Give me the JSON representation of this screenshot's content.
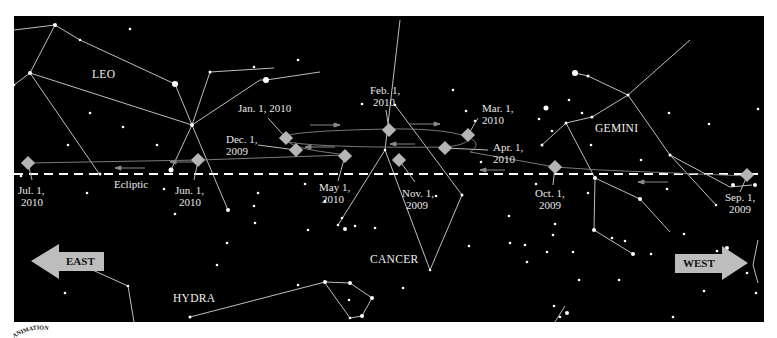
{
  "constellations": {
    "leo": "LEO",
    "gemini": "GEMINI",
    "cancer": "CANCER",
    "hydra": "HYDRA"
  },
  "ecliptic_label": "Ecliptic",
  "directions": {
    "east": "EAST",
    "west": "WEST"
  },
  "positions": [
    {
      "line1": "Sep. 1,",
      "line2": "2009"
    },
    {
      "line1": "Oct. 1,",
      "line2": "2009"
    },
    {
      "line1": "Nov. 1,",
      "line2": "2009"
    },
    {
      "line1": "Dec. 1,",
      "line2": "2009"
    },
    {
      "line1": "Jan. 1, 2010",
      "line2": ""
    },
    {
      "line1": "Feb. 1,",
      "line2": "2010"
    },
    {
      "line1": "Mar. 1,",
      "line2": "2010"
    },
    {
      "line1": "Apr. 1,",
      "line2": "2010"
    },
    {
      "line1": "May 1,",
      "line2": "2010"
    },
    {
      "line1": "Jun. 1,",
      "line2": "2010"
    },
    {
      "line1": "Jul. 1,",
      "line2": "2010"
    }
  ],
  "colors": {
    "sky": "#000000",
    "marker": "#b5b5b5",
    "ecliptic": "#ffffff",
    "lines": "#bdbdbd",
    "arrow": "#bdbdbd"
  },
  "logo_text": "ANIMATION"
}
